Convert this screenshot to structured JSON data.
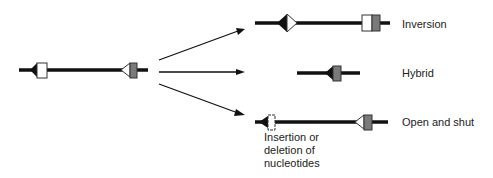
{
  "colors": {
    "line": "#111111",
    "black_marker": "#111111",
    "white_marker": "#ffffff",
    "grey_marker": "#7a7a7a",
    "stroke": "#333333"
  },
  "labels": {
    "inversion": "Inversion",
    "hybrid": "Hybrid",
    "open_and_shut": "Open and shut"
  },
  "annotation": {
    "line1": "Insertion or",
    "line2": "deletion of",
    "line3": "nucleotides"
  }
}
